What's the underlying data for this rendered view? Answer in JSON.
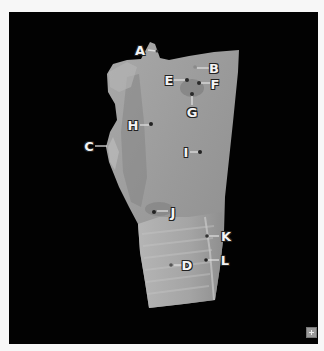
{
  "figure": {
    "background_color": "#020202",
    "labels": [
      {
        "id": "A",
        "text": "A"
      },
      {
        "id": "B",
        "text": "B"
      },
      {
        "id": "C",
        "text": "C"
      },
      {
        "id": "D",
        "text": "D"
      },
      {
        "id": "E",
        "text": "E"
      },
      {
        "id": "F",
        "text": "F"
      },
      {
        "id": "G",
        "text": "G"
      },
      {
        "id": "H",
        "text": "H"
      },
      {
        "id": "I",
        "text": "I"
      },
      {
        "id": "J",
        "text": "J"
      },
      {
        "id": "K",
        "text": "K"
      },
      {
        "id": "L",
        "text": "L"
      }
    ]
  },
  "controls": {
    "expand_icon": "plus-icon"
  }
}
